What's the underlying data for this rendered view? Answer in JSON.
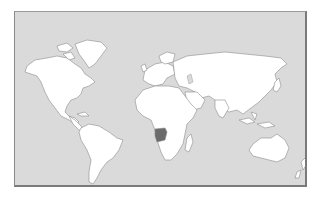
{
  "map": {
    "type": "world-locator-map",
    "projection": "equirectangular-like",
    "highlighted_country": "Angola",
    "colors": {
      "ocean": "#dadada",
      "land": "#ffffff",
      "border": "#8c8c8c",
      "highlight": "#6b6b6b",
      "frame": "#7a7a7a"
    },
    "regions": [
      "North America",
      "Greenland",
      "South America",
      "Europe",
      "Africa",
      "Asia",
      "Australia",
      "New Zealand",
      "Madagascar",
      "Japan",
      "Indonesia"
    ]
  }
}
